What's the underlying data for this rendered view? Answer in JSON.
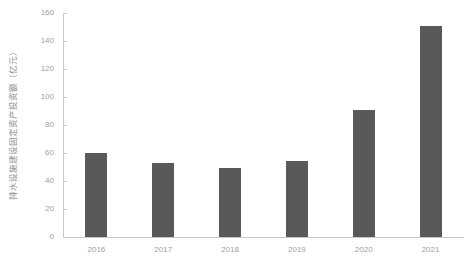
{
  "chart_data": {
    "type": "bar",
    "title": "",
    "subtitle": "",
    "xlabel": "",
    "ylabel": "排水设施建设固定资产投资额（亿元）",
    "categories": [
      "2016",
      "2017",
      "2018",
      "2019",
      "2020",
      "2021"
    ],
    "values": [
      60,
      53,
      49,
      54,
      91,
      151
    ],
    "series": [
      {
        "name": "排水设施建设固定资产投资额",
        "values": [
          60,
          53,
          49,
          54,
          91,
          151
        ]
      }
    ],
    "ylim": [
      0,
      160
    ],
    "ytick_labels": [
      "0",
      "20",
      "40",
      "60",
      "80",
      "100",
      "120",
      "140",
      "160"
    ],
    "ytick_values": [
      0,
      20,
      40,
      60,
      80,
      100,
      120,
      140,
      160
    ],
    "xlim_categories": [
      "2016",
      "2021"
    ],
    "grid": false,
    "legend": null,
    "legend_position": "none",
    "annotations": [],
    "bar_color": "#595959",
    "axis_color": "#c9c9c9",
    "tick_label_color": "#a0a0a0",
    "background_color": "#ffffff"
  }
}
